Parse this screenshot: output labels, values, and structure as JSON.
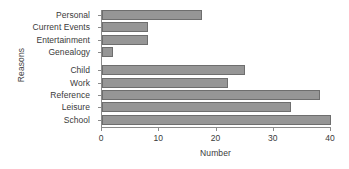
{
  "chart_data": {
    "type": "bar",
    "orientation": "horizontal",
    "title": "",
    "xlabel": "Number",
    "ylabel": "Reasons",
    "categories": [
      "Personal",
      "Current Events",
      "Entertainment",
      "Genealogy",
      "Child",
      "Work",
      "Reference",
      "Leisure",
      "School"
    ],
    "values": [
      17.5,
      8,
      8,
      2,
      25,
      22,
      38,
      33,
      40
    ],
    "xlim": [
      0,
      40
    ],
    "xticks": [
      0,
      10,
      20,
      30,
      40
    ],
    "xtick_labels": [
      "0",
      "10",
      "20",
      "30",
      "40"
    ],
    "grid": false,
    "legend": null,
    "group_gap_after_index": 3,
    "bar_color": "#969696",
    "bar_edge_color": "#6e6e6e",
    "axis_color": "#8a8a8a"
  }
}
